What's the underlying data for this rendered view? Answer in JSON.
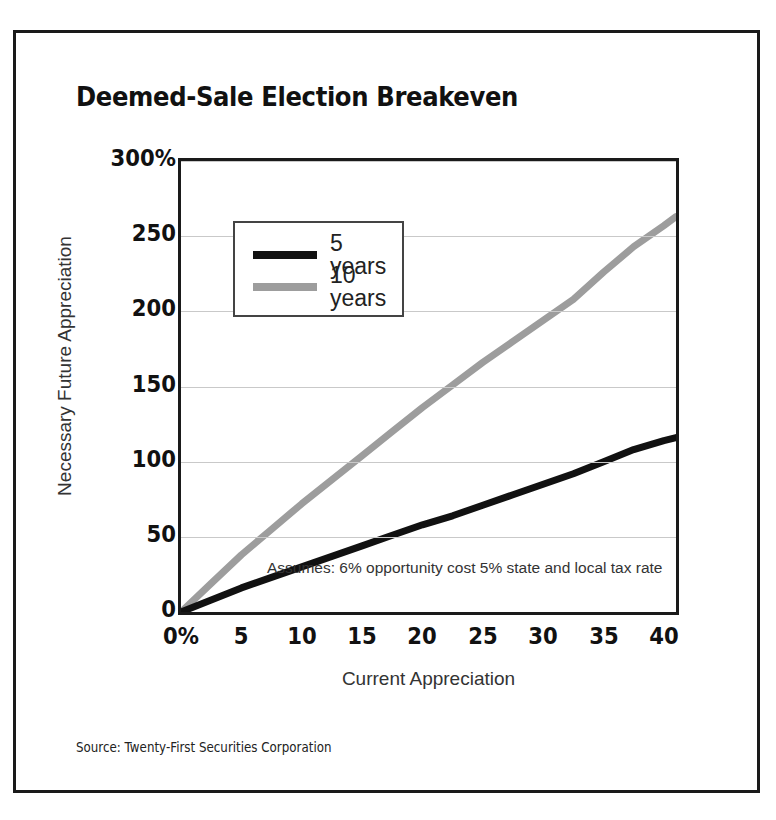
{
  "figure": {
    "title": "Deemed-Sale Election Breakeven",
    "source": "Source: Twenty-First Securities Corporation",
    "annotation": "Assumes: 6% opportunity cost 5% state and local tax rate"
  },
  "colors": {
    "series_5yr": "#111111",
    "series_10yr": "#9d9d9d",
    "border": "#1a1a1a",
    "gridline": "#c9c9c9",
    "background": "#ffffff"
  },
  "chart_data": {
    "type": "line",
    "title": "Deemed-Sale Election Breakeven",
    "xlabel": "Current Appreciation",
    "ylabel": "Necessary Future Appreciation",
    "xlim": [
      0,
      41
    ],
    "ylim": [
      0,
      300
    ],
    "xticks": [
      0,
      5,
      10,
      15,
      20,
      25,
      30,
      35,
      40
    ],
    "xticklabels": [
      "0%",
      "5",
      "10",
      "15",
      "20",
      "25",
      "30",
      "35",
      "40"
    ],
    "yticks": [
      0,
      50,
      100,
      150,
      200,
      250,
      300
    ],
    "yticklabels": [
      "0",
      "50",
      "100",
      "150",
      "200",
      "250",
      "300%"
    ],
    "grid": true,
    "legend_position": "upper-left-inside",
    "annotations": [
      "Assumes: 6% opportunity cost 5% state and local tax rate"
    ],
    "x": [
      0,
      2.5,
      5,
      7.5,
      10,
      12.5,
      15,
      17.5,
      20,
      22.5,
      25,
      27.5,
      30,
      32.5,
      35,
      37.5,
      40,
      41
    ],
    "series": [
      {
        "name": "5 years",
        "color": "#111111",
        "values": [
          0,
          8,
          16,
          23,
          30,
          37,
          44,
          51,
          58,
          64,
          71,
          78,
          85,
          92,
          100,
          108,
          114,
          116
        ]
      },
      {
        "name": "10 years",
        "color": "#9d9d9d",
        "values": [
          0,
          19,
          38,
          55,
          72,
          88,
          104,
          120,
          136,
          151,
          166,
          180,
          194,
          208,
          226,
          243,
          257,
          263
        ]
      }
    ]
  },
  "legend": {
    "items": [
      {
        "label": "5 years",
        "color": "#111111"
      },
      {
        "label": "10 years",
        "color": "#9d9d9d"
      }
    ]
  }
}
